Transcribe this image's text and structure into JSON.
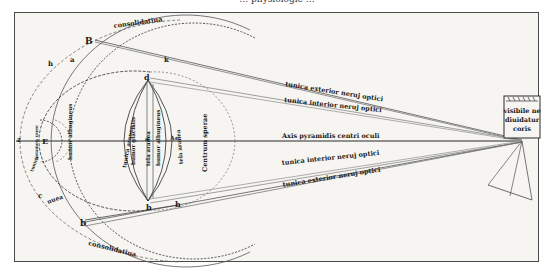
{
  "page_header": {
    "text": "… physiologie …",
    "visible": "partially cut off at top edge"
  },
  "diagram": {
    "colors": {
      "ink": "#1a1a1a",
      "paper": "#f6f5f1",
      "frame": "#4a4a4a",
      "faint_line": "#8a8a8a"
    },
    "outer_arc_labels": {
      "top": "consolidatiua",
      "bottom": "consolidatiua"
    },
    "point_letters": {
      "top_outer": "B",
      "top_mid": "k",
      "upper_left_1": "h",
      "upper_left_2": "a",
      "lens_top": "d",
      "lens_bottom": "b",
      "lower_right": "h",
      "lower_left_outer": "b",
      "lower_left_2": "c",
      "center_left": "E",
      "axis_a": "a",
      "axis_A": "A",
      "axis_e": "e",
      "axis_far_left": "z"
    },
    "inner_vertical_labels": [
      "tunica aranea",
      "humor glacialis",
      "tela aranea",
      "humor albugineus",
      "tela aranea"
    ],
    "left_labels": {
      "pupilla_region": "foramen uuee",
      "humor_label": "humor albugineus",
      "uvea": "uuea",
      "cornea_small": "tunica"
    },
    "center_label": "Centrum sperae",
    "ray_labels": [
      "tunica exterior neruj optici",
      "tunica interior neruj optici",
      "Axis pyramidis centri oculi",
      "tunica interior neruj optici",
      "tunica exterior neruj optici"
    ],
    "object_box": {
      "text_lines": [
        "visibile ne",
        "diuidatur",
        "coris"
      ]
    }
  }
}
